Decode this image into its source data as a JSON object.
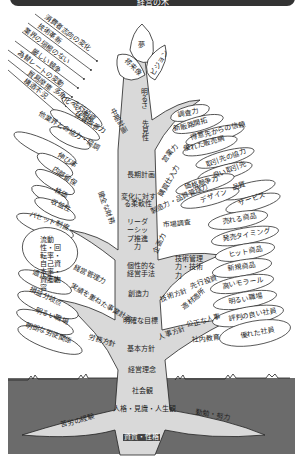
{
  "header": {
    "title": "経営の木"
  },
  "environment_arrows": [
    "消費者志向の変化",
    "技術革新",
    "業界の垣根のない",
    "厳しい競争",
    "為替レートの変動",
    "貿易摩擦",
    "構造不況"
  ],
  "crown": {
    "top": "夢",
    "left": "将来像",
    "right": "ビジョン"
  },
  "trunk": [
    "明るさ",
    "先見性",
    "長期計画",
    "変化に対する柔軟性",
    "リーダーシップ推進力",
    "個性的な経営手法",
    "創造力",
    "明確な目標",
    "基本方針",
    "経営理念",
    "社会観",
    "人格・見識・人生観",
    "資質・性格"
  ],
  "roots": {
    "left": "苦労の経験",
    "right": "勤勉・努力"
  },
  "left_branches": [
    {
      "branch": "中期計画",
      "leaves": [
        "先行投資",
        "多角化への進出",
        "体質改善力"
      ]
    },
    {
      "branch": "健全な財務",
      "leaves": [
        "他業界との協力・協調",
        "伸び率",
        "内部留保",
        "株価",
        "収益性",
        "バセット制度",
        "流動性・回転率・自己資本率・資産内容",
        "適正在庫"
      ]
    },
    {
      "branch": "経営管理力",
      "leaves": []
    },
    {
      "branch": "実績を重ねた事業計画",
      "leaves": [
        "損益分岐点",
        "明るい職場"
      ]
    },
    {
      "branch": "労務方針",
      "leaves": [
        "明朗な労使関係"
      ]
    }
  ],
  "right_branches": [
    {
      "branch": "営業力",
      "leaves": [
        "調査力",
        "新販路開拓",
        "得意先からの信頼",
        "優れた販売網"
      ]
    },
    {
      "branch": "購買仕入力",
      "leaves": [
        "取引先の協力",
        "良い取引先",
        "価格競争力",
        "品質"
      ]
    },
    {
      "branch": "製造力・品質管理力",
      "leaves": [
        "デザイン",
        "サービス"
      ]
    },
    {
      "branch": "市場調査",
      "leaves": [
        "売れる商品",
        "発売タイミング"
      ]
    },
    {
      "branch": "企画力",
      "leaves": [
        "ヒット商品"
      ]
    },
    {
      "branch": "技術管理力・技術力",
      "leaves": [
        "新規商品"
      ]
    },
    {
      "branch": "技術方針",
      "leaves": [
        "先行投資"
      ]
    },
    {
      "branch": "人事方針",
      "leaves": [
        "適材適所",
        "高いモラール",
        "公正な人事",
        "明るい職場",
        "評判の良い社員"
      ]
    },
    {
      "branch": "社内教育",
      "leaves": [
        "優れた社員"
      ]
    }
  ],
  "colors": {
    "trunk": "#d9d9d9",
    "ground": "#6b6b6b",
    "line": "#222222",
    "header": "#333333"
  }
}
